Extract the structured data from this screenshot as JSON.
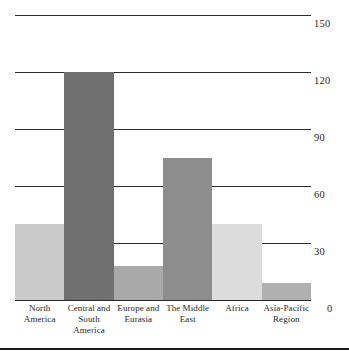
{
  "chart_data": {
    "type": "bar",
    "title": "",
    "xlabel": "",
    "ylabel": "",
    "ylim": [
      0,
      150
    ],
    "yticks": [
      "0",
      "30",
      "60",
      "90",
      "120",
      "150"
    ],
    "grid": true,
    "legend": "none",
    "categories": [
      "North America",
      "Central and South America",
      "Europe and Eurasia",
      "The Middle East",
      "Africa",
      "Asia-Pacific Region"
    ],
    "category_lines": [
      [
        "North",
        "America"
      ],
      [
        "Central and",
        "South America"
      ],
      [
        "Europe and",
        "Eurasia"
      ],
      [
        "The Middle",
        "East"
      ],
      [
        "Africa",
        ""
      ],
      [
        "Asia-Pacific",
        "Region"
      ]
    ],
    "values": [
      40,
      120,
      18,
      75,
      40,
      9
    ],
    "bar_colors": [
      "#c9c9c9",
      "#707070",
      "#a9a9a9",
      "#8d8d8d",
      "#dcdcdc",
      "#b0b0b0"
    ],
    "axis_color": "#2b2b2b"
  },
  "axis": {
    "zero_label": "0"
  }
}
